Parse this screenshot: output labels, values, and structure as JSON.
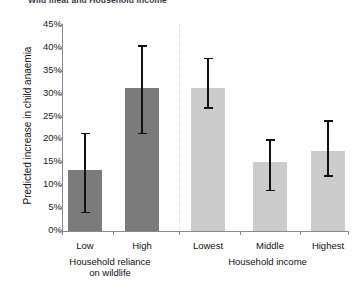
{
  "chart_data": {
    "type": "bar",
    "title": "Wild meat and Household Income",
    "xlabel": "",
    "ylabel": "Predicted increase in child anaemia",
    "ylim": [
      0,
      45
    ],
    "ytick_labels": [
      "0%",
      "5%",
      "10%",
      "15%",
      "20%",
      "25%",
      "30%",
      "35%",
      "40%",
      "45%"
    ],
    "ytick_values": [
      0,
      5,
      10,
      15,
      20,
      25,
      30,
      35,
      40,
      45
    ],
    "grid": false,
    "legend": "none",
    "value_suffix": "%",
    "groups": [
      {
        "name": "Household reliance on wildlife",
        "label_lines": [
          "Household reliance",
          "on wildlife"
        ],
        "color": "#7b7b7b",
        "categories": [
          "Low",
          "High"
        ],
        "values": [
          13.3,
          31.2
        ],
        "error_low": [
          4.2,
          21.4
        ],
        "error_high": [
          21.4,
          40.6
        ]
      },
      {
        "name": "Household income",
        "label_lines": [
          "Household income"
        ],
        "color": "#cccccc",
        "categories": [
          "Lowest",
          "Middle",
          "Highest"
        ],
        "values": [
          31.2,
          15.0,
          17.5
        ],
        "error_low": [
          27.0,
          9.0,
          12.2
        ],
        "error_high": [
          37.8,
          20.0,
          24.2
        ]
      }
    ],
    "bars": [
      {
        "category": "Low",
        "group": "Household reliance on wildlife",
        "value": 13.3,
        "error_low": 4.2,
        "error_high": 21.4,
        "color": "#7b7b7b"
      },
      {
        "category": "High",
        "group": "Household reliance on wildlife",
        "value": 31.2,
        "error_low": 21.4,
        "error_high": 40.6,
        "color": "#7b7b7b"
      },
      {
        "category": "Lowest",
        "group": "Household income",
        "value": 31.2,
        "error_low": 27.0,
        "error_high": 37.8,
        "color": "#cccccc"
      },
      {
        "category": "Middle",
        "group": "Household income",
        "value": 15.0,
        "error_low": 9.0,
        "error_high": 20.0,
        "color": "#cccccc"
      },
      {
        "category": "Highest",
        "group": "Household income",
        "value": 17.5,
        "error_low": 12.2,
        "error_high": 24.2,
        "color": "#cccccc"
      }
    ]
  },
  "colors": {
    "dark_bar": "#7b7b7b",
    "light_bar": "#cccccc",
    "axis": "#8a8a8a",
    "divider": "#d9d9d9",
    "error": "#111111"
  }
}
